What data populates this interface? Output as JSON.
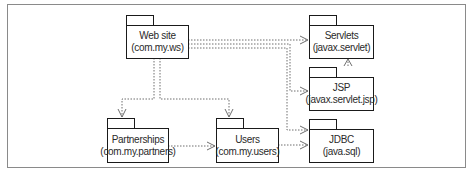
{
  "diagram": {
    "type": "UML package dependency diagram",
    "packages": [
      {
        "id": "website",
        "name": "Web site",
        "namespace": "(com.my.ws)"
      },
      {
        "id": "servlets",
        "name": "Servlets",
        "namespace": "(javax.servlet)"
      },
      {
        "id": "jsp",
        "name": "JSP",
        "namespace": "(javax.servlet.jsp)"
      },
      {
        "id": "jdbc",
        "name": "JDBC",
        "namespace": "(java.sql)"
      },
      {
        "id": "partnerships",
        "name": "Partnerships",
        "namespace": "(com.my.partners)"
      },
      {
        "id": "users",
        "name": "Users",
        "namespace": "(com.my.users)"
      }
    ],
    "dependencies": [
      {
        "from": "website",
        "to": "servlets"
      },
      {
        "from": "website",
        "to": "jsp"
      },
      {
        "from": "website",
        "to": "jdbc"
      },
      {
        "from": "website",
        "to": "partnerships"
      },
      {
        "from": "website",
        "to": "users"
      },
      {
        "from": "jsp",
        "to": "servlets"
      },
      {
        "from": "partnerships",
        "to": "users"
      },
      {
        "from": "users",
        "to": "jdbc"
      }
    ],
    "colors": {
      "box_border": "#1a1a1a",
      "dependency_line": "#6e6e6e",
      "frame_border": "#8a8a8a",
      "background": "#ffffff"
    }
  }
}
